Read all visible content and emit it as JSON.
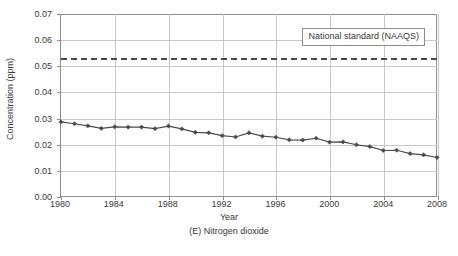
{
  "chart_data": {
    "type": "line",
    "title": "",
    "caption": "(E) Nitrogen dioxide",
    "xlabel": "Year",
    "ylabel": "Concentration (ppm)",
    "xlim": [
      1980,
      2008
    ],
    "ylim": [
      0.0,
      0.07
    ],
    "ytick_step": 0.01,
    "xtick_step": 4,
    "grid": true,
    "legend_position": "top-right-inside",
    "x": [
      1980,
      1981,
      1982,
      1983,
      1984,
      1985,
      1986,
      1987,
      1988,
      1989,
      1990,
      1991,
      1992,
      1993,
      1994,
      1995,
      1996,
      1997,
      1998,
      1999,
      2000,
      2001,
      2002,
      2003,
      2004,
      2005,
      2006,
      2007,
      2008
    ],
    "values": [
      0.0285,
      0.0278,
      0.027,
      0.026,
      0.0266,
      0.0265,
      0.0265,
      0.0259,
      0.0269,
      0.0258,
      0.0245,
      0.0243,
      0.0232,
      0.0227,
      0.0243,
      0.023,
      0.0226,
      0.0216,
      0.0215,
      0.0222,
      0.0207,
      0.0208,
      0.0197,
      0.019,
      0.0175,
      0.0176,
      0.0163,
      0.0158,
      0.0148
    ],
    "ytick_labels": [
      "0.00",
      "0.01",
      "0.02",
      "0.03",
      "0.04",
      "0.05",
      "0.06",
      "0.07"
    ],
    "ytick_values": [
      0.0,
      0.01,
      0.02,
      0.03,
      0.04,
      0.05,
      0.06,
      0.07
    ],
    "xtick_labels": [
      "1980",
      "1984",
      "1988",
      "1992",
      "1996",
      "2000",
      "2004",
      "2008"
    ],
    "xtick_values": [
      1980,
      1984,
      1988,
      1992,
      1996,
      2000,
      2004,
      2008
    ],
    "series": [
      {
        "name": "Nitrogen dioxide annual mean",
        "style": "line-with-diamond-markers",
        "color": "#4a4a4a",
        "values": [
          0.0285,
          0.0278,
          0.027,
          0.026,
          0.0266,
          0.0265,
          0.0265,
          0.0259,
          0.0269,
          0.0258,
          0.0245,
          0.0243,
          0.0232,
          0.0227,
          0.0243,
          0.023,
          0.0226,
          0.0216,
          0.0215,
          0.0222,
          0.0207,
          0.0208,
          0.0197,
          0.019,
          0.0175,
          0.0176,
          0.0163,
          0.0158,
          0.0148
        ]
      }
    ],
    "reference_lines": [
      {
        "label": "National standard (NAAQS)",
        "value": 0.053,
        "style": "dashed",
        "color": "#4a4a4a"
      }
    ],
    "colors": {
      "series_line": "#4a4a4a",
      "grid": "#c9c9c9",
      "axis": "#8d8d8d",
      "text": "#3a3a3a",
      "background": "#ffffff"
    }
  }
}
